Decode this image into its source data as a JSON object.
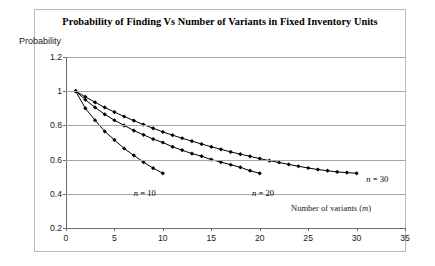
{
  "chart_data": {
    "type": "line",
    "title": "Probability of Finding Vs Number of Variants in Fixed Inventory Units",
    "xlabel_text": "Number of variants (",
    "xlabel_var": "m",
    "xlabel_close": ")",
    "ylabel": "Probability",
    "xlim": [
      0,
      35
    ],
    "ylim": [
      0.2,
      1.2
    ],
    "xticks": [
      0,
      5,
      10,
      15,
      20,
      25,
      30,
      35
    ],
    "yticks": [
      "0.2",
      "0.4",
      "0.6",
      "0.8",
      "1",
      "1.2"
    ],
    "ytick_values": [
      0.2,
      0.4,
      0.6,
      0.8,
      1.0,
      1.2
    ],
    "grid": true,
    "legend_position": "inline-annotations",
    "marker": "filled-diamond",
    "line_color": "#000000",
    "grid_color": "#a6a6a6",
    "series": [
      {
        "name": "n = 10",
        "name_var": "n",
        "name_rest": "= 10",
        "label_x": 7.0,
        "label_y": 0.435,
        "x": [
          1,
          2,
          3,
          4,
          5,
          6,
          7,
          8,
          9,
          10
        ],
        "values": [
          1.0,
          0.9,
          0.83,
          0.765,
          0.715,
          0.665,
          0.625,
          0.585,
          0.55,
          0.52
        ]
      },
      {
        "name": "n = 20",
        "name_var": "n",
        "name_rest": "= 20",
        "label_x": 19.2,
        "label_y": 0.435,
        "x": [
          1,
          2,
          3,
          4,
          5,
          6,
          7,
          8,
          9,
          10,
          11,
          12,
          13,
          14,
          15,
          16,
          17,
          18,
          19,
          20
        ],
        "values": [
          1.0,
          0.95,
          0.905,
          0.865,
          0.83,
          0.8,
          0.77,
          0.745,
          0.72,
          0.7,
          0.675,
          0.655,
          0.635,
          0.62,
          0.6,
          0.585,
          0.57,
          0.555,
          0.535,
          0.52
        ]
      },
      {
        "name": "n = 30",
        "name_var": "n",
        "name_rest": "= 30",
        "label_x": 31.0,
        "label_y": 0.515,
        "x": [
          1,
          2,
          3,
          4,
          5,
          6,
          7,
          8,
          9,
          10,
          11,
          12,
          13,
          14,
          15,
          16,
          17,
          18,
          19,
          20,
          21,
          22,
          23,
          24,
          25,
          26,
          27,
          28,
          29,
          30
        ],
        "values": [
          1.0,
          0.967,
          0.935,
          0.905,
          0.878,
          0.852,
          0.828,
          0.805,
          0.783,
          0.762,
          0.743,
          0.725,
          0.708,
          0.691,
          0.675,
          0.66,
          0.645,
          0.632,
          0.619,
          0.606,
          0.594,
          0.583,
          0.572,
          0.561,
          0.551,
          0.542,
          0.535,
          0.528,
          0.524,
          0.52
        ]
      }
    ]
  }
}
